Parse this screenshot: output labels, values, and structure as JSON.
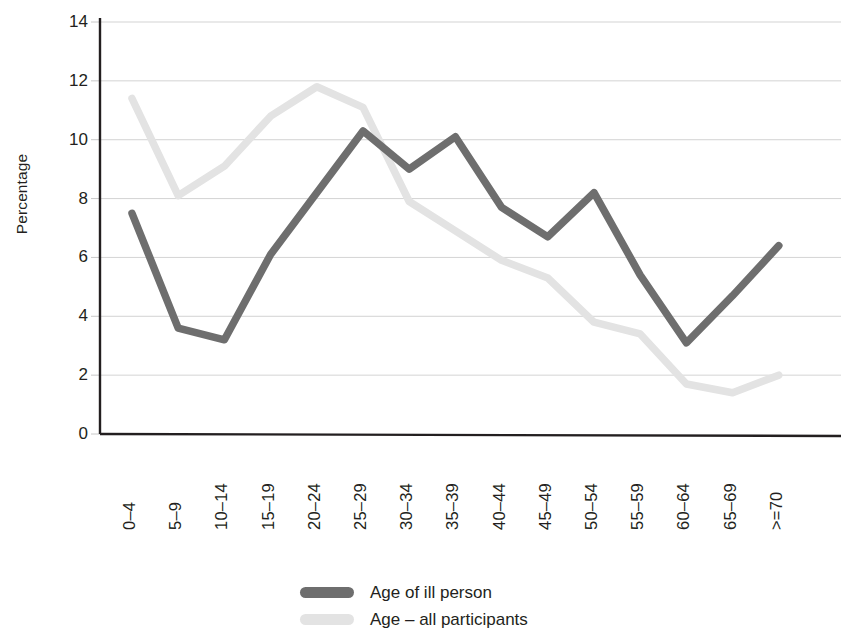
{
  "chart_data": {
    "type": "line",
    "title": "",
    "xlabel": "",
    "ylabel": "Percentage",
    "ylim": [
      0,
      14
    ],
    "ytick_step": 2,
    "yticks": [
      "14",
      "12",
      "10",
      "8",
      "6",
      "4",
      "2",
      "0"
    ],
    "grid": true,
    "legend_position": "bottom-center",
    "categories": [
      "0–4",
      "5–9",
      "10–14",
      "15–19",
      "20–24",
      "25–29",
      "30–34",
      "35–39",
      "40–44",
      "45–49",
      "50–54",
      "55–59",
      "60–64",
      "65–69",
      ">=70"
    ],
    "series": [
      {
        "name": "Age of ill person",
        "color": "#6e6e6e",
        "values": [
          7.5,
          3.6,
          3.2,
          6.1,
          8.2,
          10.3,
          9.0,
          10.1,
          7.7,
          6.7,
          8.2,
          5.4,
          3.1,
          4.7,
          6.4
        ]
      },
      {
        "name": "Age – all participants",
        "color": "#e3e3e3",
        "values": [
          11.4,
          8.1,
          9.1,
          10.8,
          11.8,
          11.1,
          7.9,
          6.9,
          5.9,
          5.3,
          3.8,
          3.4,
          1.7,
          1.4,
          2.0
        ]
      }
    ]
  },
  "axis": {
    "axis_color": "#231f20",
    "grid_color": "#c8c8c8"
  },
  "legend": {
    "items": [
      {
        "label": "Age of ill person",
        "color": "#6e6e6e"
      },
      {
        "label": "Age – all participants",
        "color": "#e3e3e3"
      }
    ]
  }
}
